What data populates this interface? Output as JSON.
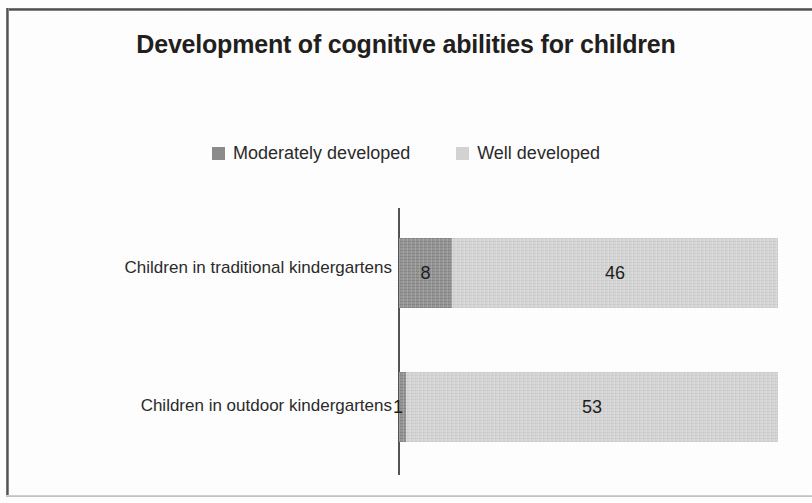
{
  "chart": {
    "title": "Development of cognitive abilities for children",
    "title_line1": "Development of cognitive abilities for",
    "title_line2": "children"
  },
  "legend": {
    "items": [
      {
        "label": "Moderately developed",
        "color": "#8c8c8c",
        "swatch_name": "legend-swatch-moderately-developed"
      },
      {
        "label": "Well developed",
        "color": "#d4d4d4",
        "swatch_name": "legend-swatch-well-developed"
      }
    ]
  },
  "categories": [
    {
      "label": "Children in traditional kindergartens"
    },
    {
      "label": "Children in outdoor kindergartens"
    }
  ],
  "bars": [
    {
      "category": "Children in traditional kindergartens",
      "segments": [
        {
          "series": "Moderately developed",
          "value": "8",
          "width_px": 53,
          "color": "#8c8c8c",
          "label_position": "inside"
        },
        {
          "series": "Well developed",
          "value": "46",
          "width_px": 326,
          "color": "#d4d4d4",
          "label_position": "inside"
        }
      ]
    },
    {
      "category": "Children in outdoor kindergartens",
      "segments": [
        {
          "series": "Moderately developed",
          "value": "1",
          "width_px": 7,
          "color": "#8c8c8c",
          "label_position": "outside"
        },
        {
          "series": "Well developed",
          "value": "53",
          "width_px": 372,
          "color": "#d4d4d4",
          "label_position": "inside"
        }
      ]
    }
  ],
  "axis": {
    "value_axis_visible": true,
    "value_axis_tick_labels": [],
    "gridlines": false
  },
  "chart_data": {
    "type": "bar",
    "orientation": "horizontal",
    "stacked": true,
    "title": "Development of cognitive abilities for children",
    "xlabel": "",
    "ylabel": "",
    "categories": [
      "Children in traditional kindergartens",
      "Children in outdoor kindergartens"
    ],
    "series": [
      {
        "name": "Moderately developed",
        "values": [
          8,
          1
        ],
        "color": "#8c8c8c"
      },
      {
        "name": "Well developed",
        "values": [
          46,
          53
        ],
        "color": "#d4d4d4"
      }
    ],
    "totals": [
      54,
      54
    ],
    "data_labels": [
      [
        "8",
        "46"
      ],
      [
        "1",
        "53"
      ]
    ],
    "xlim": [
      0,
      54
    ],
    "tick_labels": [],
    "grid": false,
    "legend_position": "top"
  }
}
